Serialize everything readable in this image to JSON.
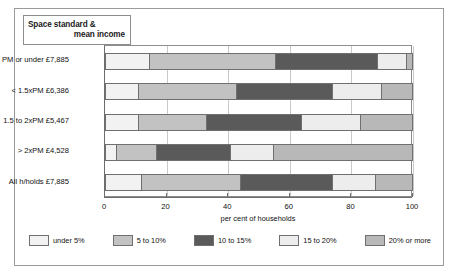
{
  "chart_data": {
    "type": "bar",
    "orientation": "horizontal",
    "stacked": true,
    "title": "Space standard & mean income",
    "title_lines": [
      "Space standard &",
      "mean income"
    ],
    "xlabel": "per cent  of households",
    "ylabel": "",
    "xlim": [
      0,
      100
    ],
    "xticks": [
      0,
      20,
      40,
      60,
      80,
      100
    ],
    "xticklabels": [
      "0",
      "20",
      "40",
      "60",
      "80",
      "100"
    ],
    "grid": true,
    "grid_axis": "x",
    "legend_position": "bottom",
    "categories": [
      "PM or under  £7,885",
      "< 1.5xPM £6,386",
      "1.5 to 2xPM £5,467",
      "> 2xPM £4,528",
      "All h/holds £7,885"
    ],
    "series": [
      {
        "name": "under 5%",
        "color": "#f2f2f2",
        "values": [
          14.6,
          11.0,
          11.0,
          4.0,
          12.0
        ]
      },
      {
        "name": "5 to 10%",
        "color": "#c2c2c2",
        "values": [
          41.0,
          32.0,
          22.0,
          13.0,
          32.0
        ]
      },
      {
        "name": "10 to 15%",
        "color": "#5a5a5a",
        "values": [
          33.0,
          31.0,
          31.0,
          24.0,
          30.0
        ]
      },
      {
        "name": "15 to 20%",
        "color": "#ededed",
        "values": [
          9.5,
          16.0,
          19.0,
          14.0,
          14.0
        ]
      },
      {
        "name": "20% or more",
        "color": "#b8b8b8",
        "values": [
          1.9,
          10.0,
          17.0,
          45.0,
          12.0
        ]
      }
    ],
    "legend": [
      {
        "label": "under 5%",
        "color": "#f2f2f2"
      },
      {
        "label": "5 to 10%",
        "color": "#c2c2c2"
      },
      {
        "label": "10 to 15%",
        "color": "#5a5a5a"
      },
      {
        "label": "15 to 20%",
        "color": "#ededed"
      },
      {
        "label": "20% or more",
        "color": "#b8b8b8"
      }
    ]
  }
}
